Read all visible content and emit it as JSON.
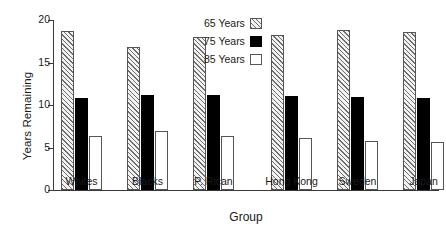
{
  "chart_data": {
    "type": "bar",
    "title": "",
    "xlabel": "Group",
    "ylabel": "Years Remaining",
    "ylim": [
      0,
      20
    ],
    "yticks": [
      0,
      5,
      10,
      15,
      20
    ],
    "grid": false,
    "legend_position": "top-center",
    "categories": [
      "Whites",
      "Blacks",
      "P. Rican",
      "Hong Kong",
      "Sweden",
      "Japan"
    ],
    "group_gap_after_index": 2,
    "series": [
      {
        "name": "65 Years",
        "swatch": "hatched",
        "values": [
          18.7,
          16.8,
          18.0,
          18.2,
          18.8,
          18.6
        ]
      },
      {
        "name": "75 Years",
        "swatch": "solid-black",
        "values": [
          10.8,
          11.2,
          11.2,
          11.1,
          10.9,
          10.8
        ]
      },
      {
        "name": "85 Years",
        "swatch": "open-white",
        "values": [
          6.4,
          7.0,
          6.4,
          6.1,
          5.8,
          5.6
        ]
      }
    ]
  },
  "axis": {
    "y_title": "Years Remaining",
    "x_title": "Group",
    "y_tick_labels": [
      "0",
      "5",
      "10",
      "15",
      "20"
    ]
  },
  "legend": {
    "items": [
      {
        "label": "65 Years"
      },
      {
        "label": "75 Years"
      },
      {
        "label": "85 Years"
      }
    ]
  },
  "x_labels": [
    "Whites",
    "Blacks",
    "P. Rican",
    "Hong Kong",
    "Sweden",
    "Japan"
  ]
}
